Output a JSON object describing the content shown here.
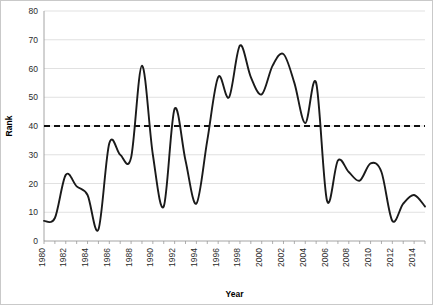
{
  "chart_data": {
    "type": "line",
    "title": "",
    "xlabel": "Year",
    "ylabel": "Rank",
    "xlim": [
      1980,
      2015
    ],
    "ylim": [
      0,
      80
    ],
    "yticks": [
      0,
      10,
      20,
      30,
      40,
      50,
      60,
      70,
      80
    ],
    "xticks": [
      1980,
      1982,
      1984,
      1986,
      1988,
      1990,
      1992,
      1994,
      1996,
      1998,
      2000,
      2002,
      2004,
      2006,
      2008,
      2010,
      2012,
      2014
    ],
    "grid": "horizontal",
    "legend": "none",
    "line_color": "#1a1a1a",
    "gridline_color": "#d9d9d9",
    "background_color": "#ffffff",
    "annotations": [
      {
        "name": "threshold",
        "type": "horizontal-reference-line",
        "value": 40,
        "style": "dashed",
        "color": "#111111"
      }
    ],
    "x": [
      1980,
      1981,
      1982,
      1983,
      1984,
      1985,
      1986,
      1987,
      1988,
      1989,
      1990,
      1991,
      1992,
      1993,
      1994,
      1995,
      1996,
      1997,
      1998,
      1999,
      2000,
      2001,
      2002,
      2003,
      2004,
      2005,
      2006,
      2007,
      2008,
      2009,
      2010,
      2011,
      2012,
      2013,
      2014,
      2015
    ],
    "values": [
      7,
      8,
      23,
      19,
      16,
      4,
      34,
      30,
      29,
      61,
      30,
      12,
      46,
      28,
      13,
      35,
      57,
      50,
      68,
      57,
      51,
      61,
      65,
      55,
      41,
      55,
      14,
      28,
      24,
      21,
      27,
      24,
      7,
      13,
      16,
      12
    ],
    "series": [
      {
        "name": "Rank",
        "values": [
          7,
          8,
          23,
          19,
          16,
          4,
          34,
          30,
          29,
          61,
          30,
          12,
          46,
          28,
          13,
          35,
          57,
          50,
          68,
          57,
          51,
          61,
          65,
          55,
          41,
          55,
          14,
          28,
          24,
          21,
          27,
          24,
          7,
          13,
          16,
          12
        ]
      }
    ]
  },
  "axes": {
    "y_title": "Rank",
    "x_title": "Year"
  }
}
